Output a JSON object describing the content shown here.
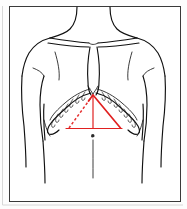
{
  "figure": {
    "title": "Anterior thorax line drawing with red cardiac-dullness triangle overlay",
    "width": 187,
    "height": 209,
    "background_color": "#ffffff",
    "panel_border_color": "#3a3a3a",
    "anatomy_line_color": "#111111",
    "marker_color": "#e02020",
    "marker_dashed_color": "#e53030",
    "parts": {
      "neck": "neck",
      "left_shoulder": "left-shoulder",
      "right_shoulder": "right-shoulder",
      "left_arm": "left-arm",
      "right_arm": "right-arm",
      "clavicle_left": "left-clavicle",
      "clavicle_right": "right-clavicle",
      "sternum": "sternum",
      "rib_cage_left": "left-costal-margin",
      "rib_cage_right": "right-costal-margin",
      "abdomen": "abdomen",
      "navel": "umbilicus"
    },
    "overlay": {
      "shape": "triangle",
      "apex_label": "xiphoid-apex",
      "left_side_style": "dashed",
      "right_side_style": "solid",
      "base_style": "solid",
      "midline_style": "solid",
      "apex": [
        93,
        95
      ],
      "base_left": [
        69,
        128
      ],
      "base_right": [
        120,
        128
      ],
      "midline_bottom": [
        93,
        128
      ]
    }
  }
}
